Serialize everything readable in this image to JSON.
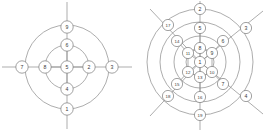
{
  "figure": {
    "background_color": "#ffffff",
    "line_color": "#8a8a8a",
    "node_fill": "#ffffff",
    "node_stroke": "#7a7a7a",
    "label_color": "#3a3a3a",
    "diagram_count": 2
  },
  "left_diagram": {
    "name": "nine-node-radial-graph",
    "center": {
      "x": 67,
      "y": 67
    },
    "rings": [
      {
        "name": "inner-ring",
        "cx": 67,
        "cy": 67,
        "r": 22
      },
      {
        "name": "outer-ring",
        "cx": 67,
        "cy": 67,
        "r": 42
      }
    ],
    "nodes": [
      {
        "id": 1,
        "label": "1",
        "x": 67,
        "y": 109,
        "r": 6.2
      },
      {
        "id": 2,
        "label": "2",
        "x": 89,
        "y": 67,
        "r": 6.2
      },
      {
        "id": 3,
        "label": "3",
        "x": 112,
        "y": 67,
        "r": 6.2
      },
      {
        "id": 4,
        "label": "4",
        "x": 67,
        "y": 89,
        "r": 6.2
      },
      {
        "id": 5,
        "label": "5",
        "x": 67,
        "y": 67,
        "r": 6.2
      },
      {
        "id": 6,
        "label": "6",
        "x": 67,
        "y": 45,
        "r": 6.2
      },
      {
        "id": 7,
        "label": "7",
        "x": 22,
        "y": 67,
        "r": 6.2
      },
      {
        "id": 8,
        "label": "8",
        "x": 45,
        "y": 67,
        "r": 6.2
      },
      {
        "id": 9,
        "label": "9",
        "x": 67,
        "y": 27,
        "r": 6.2
      }
    ],
    "spokes": [
      {
        "from": "center",
        "to": "north",
        "x1": 67,
        "y1": 67,
        "x2": 67,
        "y2": 2
      },
      {
        "from": "center",
        "to": "south",
        "x1": 67,
        "y1": 67,
        "x2": 67,
        "y2": 129
      },
      {
        "from": "center",
        "to": "west",
        "x1": 67,
        "y1": 67,
        "x2": 2,
        "y2": 67
      },
      {
        "from": "center",
        "to": "east",
        "x1": 67,
        "y1": 67,
        "x2": 132,
        "y2": 67
      }
    ]
  },
  "right_diagram": {
    "name": "nineteen-node-concentric-graph",
    "center": {
      "x": 200,
      "y": 62
    },
    "rings": [
      {
        "name": "ring-1-innermost",
        "cx": 200,
        "cy": 62,
        "r": 14
      },
      {
        "name": "ring-2",
        "cx": 200,
        "cy": 62,
        "r": 26
      },
      {
        "name": "ring-3",
        "cx": 200,
        "cy": 62,
        "r": 40
      },
      {
        "name": "ring-4-outermost",
        "cx": 200,
        "cy": 62,
        "r": 53
      }
    ],
    "nodes": [
      {
        "id": 1,
        "label": "1",
        "x": 200,
        "y": 62,
        "r": 5.6
      },
      {
        "id": 2,
        "label": "2",
        "x": 200,
        "y": 9,
        "r": 5.6
      },
      {
        "id": 3,
        "label": "3",
        "x": 246,
        "y": 28,
        "r": 5.6
      },
      {
        "id": 4,
        "label": "4",
        "x": 246,
        "y": 96,
        "r": 5.6
      },
      {
        "id": 5,
        "label": "5",
        "x": 200,
        "y": 28,
        "r": 5.6
      },
      {
        "id": 6,
        "label": "6",
        "x": 223,
        "y": 41,
        "r": 5.6
      },
      {
        "id": 7,
        "label": "7",
        "x": 223,
        "y": 84,
        "r": 5.6
      },
      {
        "id": 8,
        "label": "8",
        "x": 200,
        "y": 48,
        "r": 5.6
      },
      {
        "id": 9,
        "label": "9",
        "x": 212,
        "y": 53,
        "r": 5.6
      },
      {
        "id": 10,
        "label": "10",
        "x": 212,
        "y": 72,
        "r": 5.6
      },
      {
        "id": 11,
        "label": "11",
        "x": 188,
        "y": 53,
        "r": 5.6
      },
      {
        "id": 12,
        "label": "12",
        "x": 188,
        "y": 72,
        "r": 5.6
      },
      {
        "id": 13,
        "label": "13",
        "x": 200,
        "y": 77,
        "r": 5.6
      },
      {
        "id": 14,
        "label": "14",
        "x": 177,
        "y": 41,
        "r": 5.6
      },
      {
        "id": 15,
        "label": "15",
        "x": 177,
        "y": 84,
        "r": 5.6
      },
      {
        "id": 16,
        "label": "16",
        "x": 200,
        "y": 97,
        "r": 5.6
      },
      {
        "id": 17,
        "label": "17",
        "x": 168,
        "y": 25,
        "r": 5.6
      },
      {
        "id": 18,
        "label": "18",
        "x": 168,
        "y": 96,
        "r": 5.6
      },
      {
        "id": 19,
        "label": "19",
        "x": 200,
        "y": 115,
        "r": 5.6
      }
    ],
    "spokes": [
      {
        "name": "north-spoke",
        "x1": 200,
        "y1": 62,
        "x2": 200,
        "y2": 1
      },
      {
        "name": "south-spoke",
        "x1": 200,
        "y1": 62,
        "x2": 200,
        "y2": 130
      },
      {
        "name": "northwest-spoke",
        "x1": 200,
        "y1": 62,
        "x2": 150,
        "y2": 9
      },
      {
        "name": "northeast-spoke",
        "x1": 200,
        "y1": 62,
        "x2": 263,
        "y2": 11
      },
      {
        "name": "southwest-spoke",
        "x1": 200,
        "y1": 62,
        "x2": 150,
        "y2": 116
      },
      {
        "name": "southeast-spoke",
        "x1": 200,
        "y1": 62,
        "x2": 263,
        "y2": 114
      }
    ]
  }
}
